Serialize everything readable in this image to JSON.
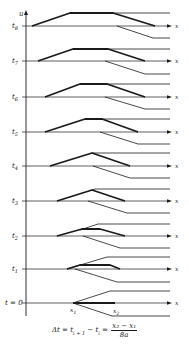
{
  "diagram": {
    "axis": {
      "x": 26,
      "top": 10,
      "bottom": 316,
      "label": "u"
    },
    "x_end": 172,
    "x_label": "x",
    "line_color": "#1a1a1a",
    "rows": [
      {
        "label": "t",
        "sub": "8",
        "y": 26,
        "thick": [
          [
            32,
            26
          ],
          [
            70,
            13
          ],
          [
            113,
            13
          ],
          [
            155,
            26
          ]
        ],
        "upper": [
          [
            113,
            13
          ],
          [
            170,
            13
          ]
        ],
        "lower": [
          [
            117,
            26
          ],
          [
            153,
            38
          ],
          [
            170,
            38
          ]
        ]
      },
      {
        "label": "t",
        "sub": "7",
        "y": 61,
        "thick": [
          [
            38,
            61
          ],
          [
            73,
            49
          ],
          [
            108,
            49
          ],
          [
            145,
            61
          ]
        ],
        "upper": [
          [
            108,
            49
          ],
          [
            170,
            49
          ]
        ],
        "lower": [
          [
            105,
            61
          ],
          [
            145,
            74
          ],
          [
            170,
            74
          ]
        ]
      },
      {
        "label": "t",
        "sub": "6",
        "y": 97,
        "thick": [
          [
            45,
            97
          ],
          [
            80,
            84
          ],
          [
            107,
            84
          ],
          [
            145,
            97
          ]
        ],
        "upper": [
          [
            107,
            84
          ],
          [
            170,
            84
          ]
        ],
        "lower": [
          [
            105,
            97
          ],
          [
            145,
            109
          ],
          [
            170,
            109
          ]
        ]
      },
      {
        "label": "t",
        "sub": "5",
        "y": 132,
        "thick": [
          [
            45,
            132
          ],
          [
            85,
            119
          ],
          [
            102,
            119
          ],
          [
            138,
            132
          ]
        ],
        "upper": [
          [
            102,
            119
          ],
          [
            170,
            119
          ]
        ],
        "lower": [
          [
            100,
            132
          ],
          [
            138,
            144
          ],
          [
            170,
            144
          ]
        ]
      },
      {
        "label": "t",
        "sub": "4",
        "y": 166,
        "thick": [
          [
            50,
            166
          ],
          [
            92,
            153
          ],
          [
            130,
            166
          ]
        ],
        "upper": [
          [
            92,
            153
          ],
          [
            170,
            153
          ]
        ],
        "lower": [
          [
            93,
            166
          ],
          [
            130,
            178
          ],
          [
            170,
            178
          ]
        ]
      },
      {
        "label": "t",
        "sub": "3",
        "y": 201,
        "thick": [
          [
            57,
            201
          ],
          [
            92,
            190
          ],
          [
            125,
            201
          ]
        ],
        "upper": [
          [
            92,
            190
          ],
          [
            95,
            189
          ],
          [
            170,
            189
          ]
        ],
        "lower": [
          [
            88,
            201
          ],
          [
            127,
            213
          ],
          [
            170,
            213
          ]
        ]
      },
      {
        "label": "t",
        "sub": "2",
        "y": 236,
        "thick": [
          [
            57,
            236
          ],
          [
            82,
            229
          ],
          [
            100,
            229
          ],
          [
            125,
            236
          ]
        ],
        "upper": [
          [
            80,
            230
          ],
          [
            98,
            224
          ],
          [
            170,
            224
          ]
        ],
        "lower": [
          [
            83,
            236
          ],
          [
            120,
            248
          ],
          [
            170,
            248
          ]
        ]
      },
      {
        "label": "t",
        "sub": "1",
        "y": 269,
        "thick": [
          [
            67,
            269
          ],
          [
            80,
            265
          ],
          [
            110,
            265
          ],
          [
            120,
            269
          ]
        ],
        "upper": [
          [
            67,
            269
          ],
          [
            107,
            257
          ],
          [
            170,
            257
          ]
        ],
        "lower": [
          [
            75,
            269
          ],
          [
            117,
            282
          ],
          [
            170,
            282
          ]
        ]
      },
      {
        "label": "t = 0",
        "sub": "",
        "y": 303,
        "thick": [
          [
            73,
            303
          ],
          [
            115,
            303
          ]
        ],
        "upper": [
          [
            73,
            303
          ],
          [
            110,
            291
          ],
          [
            170,
            291
          ]
        ],
        "lower": [
          [
            73,
            303
          ],
          [
            112,
            316
          ],
          [
            170,
            316
          ]
        ]
      }
    ],
    "points": [
      {
        "label": "x",
        "sub": "1",
        "x": 70,
        "y": 312
      },
      {
        "label": "x",
        "sub": "2",
        "x": 113,
        "y": 313
      }
    ]
  },
  "formula": {
    "lhs": "Δt = t",
    "sub1": "i + 1",
    "mid": " − t",
    "sub2": "i",
    "eq": " = ",
    "numerator": "x₂ − x₁",
    "denominator": "8a"
  }
}
